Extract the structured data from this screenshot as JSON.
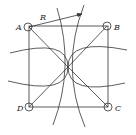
{
  "diagram": {
    "labels": {
      "A": "A",
      "B": "B",
      "C": "C",
      "D": "D",
      "R": "R"
    },
    "stroke": "#333333",
    "background": "#ffffff"
  }
}
